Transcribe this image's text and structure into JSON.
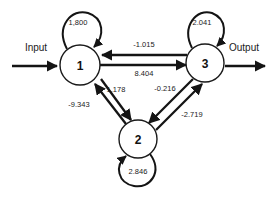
{
  "diagram": {
    "type": "directed-weighted-graph",
    "title": "",
    "io": {
      "input_label": "Input",
      "output_label": "Output"
    },
    "nodes": [
      {
        "id": "1",
        "label": "1",
        "cx": 80,
        "cy": 65,
        "r": 20
      },
      {
        "id": "2",
        "label": "2",
        "cx": 138,
        "cy": 139,
        "r": 19
      },
      {
        "id": "3",
        "label": "3",
        "cx": 205,
        "cy": 63,
        "r": 19
      }
    ],
    "self_loops": [
      {
        "node": "1",
        "weight": "1,800",
        "label_x": 78,
        "label_y": 22
      },
      {
        "node": "3",
        "weight": "2.041",
        "label_x": 202,
        "label_y": 22
      },
      {
        "node": "2",
        "weight": "2.846",
        "label_x": 138,
        "label_y": 171
      }
    ],
    "edges": [
      {
        "from": "3",
        "to": "1",
        "weight": "-1.015",
        "label_x": 144,
        "label_y": 44
      },
      {
        "from": "1",
        "to": "3",
        "weight": "8.404",
        "label_x": 144,
        "label_y": 72
      },
      {
        "from": "2",
        "to": "1",
        "weight": "-9.343",
        "label_x": 80,
        "label_y": 103
      },
      {
        "from": "1",
        "to": "2",
        "weight": "1.178",
        "label_x": 115,
        "label_y": 89
      },
      {
        "from": "3",
        "to": "2",
        "weight": "-0.216",
        "label_x": 164,
        "label_y": 88
      },
      {
        "from": "2",
        "to": "3",
        "weight": "-2.719",
        "label_x": 191,
        "label_y": 113
      }
    ],
    "colors": {
      "stroke": "#141414",
      "node_fill": "#ffffff",
      "background": "#ffffff",
      "text": "#1a1a1a"
    }
  }
}
